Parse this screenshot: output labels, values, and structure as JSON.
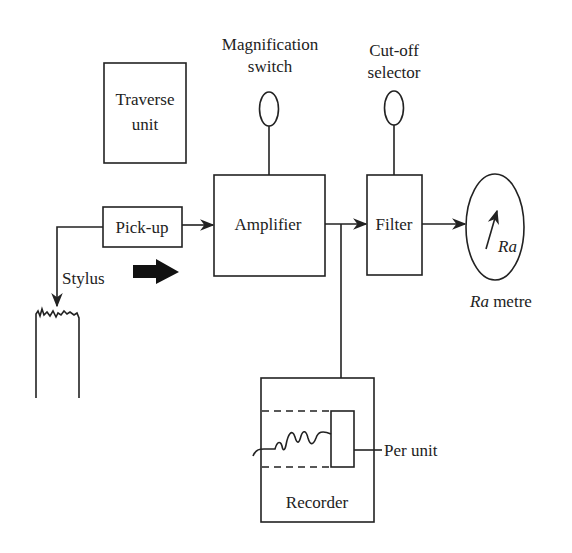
{
  "diagram": {
    "blocks": {
      "traverse_unit": {
        "line1": "Traverse",
        "line2": "unit"
      },
      "pickup": {
        "label": "Pick-up"
      },
      "amplifier": {
        "label": "Amplifier"
      },
      "filter": {
        "label": "Filter"
      },
      "recorder": {
        "label": "Recorder"
      }
    },
    "controls": {
      "magnification_switch": {
        "line1": "Magnification",
        "line2": "switch"
      },
      "cutoff_selector": {
        "line1": "Cut-off",
        "line2": "selector"
      }
    },
    "meter": {
      "dial_label": "Ra",
      "caption_italic": "Ra",
      "caption_rest": " metre"
    },
    "annotations": {
      "stylus": "Stylus",
      "pen_unit": "Per unit"
    },
    "colors": {
      "line": "#222222",
      "background": "#ffffff"
    }
  }
}
